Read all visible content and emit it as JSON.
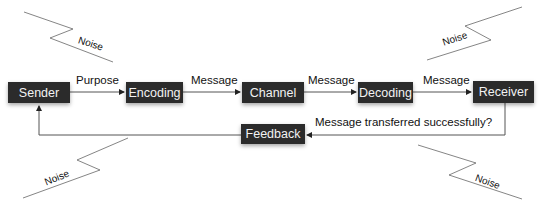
{
  "diagram": {
    "nodes": [
      {
        "id": "sender",
        "label": "Sender"
      },
      {
        "id": "encoding",
        "label": "Encoding"
      },
      {
        "id": "channel",
        "label": "Channel"
      },
      {
        "id": "decoding",
        "label": "Decoding"
      },
      {
        "id": "receiver",
        "label": "Receiver"
      },
      {
        "id": "feedback",
        "label": "Feedback"
      }
    ],
    "edges": [
      {
        "from": "sender",
        "to": "encoding",
        "label": "Purpose"
      },
      {
        "from": "encoding",
        "to": "channel",
        "label": "Message"
      },
      {
        "from": "channel",
        "to": "decoding",
        "label": "Message"
      },
      {
        "from": "decoding",
        "to": "receiver",
        "label": "Message"
      },
      {
        "from": "receiver",
        "to": "feedback",
        "label": "Message transferred successfully?"
      },
      {
        "from": "feedback",
        "to": "sender",
        "label": ""
      }
    ],
    "noise": [
      {
        "position": "top-left",
        "label": "Noise"
      },
      {
        "position": "top-right",
        "label": "Noise"
      },
      {
        "position": "bottom-left",
        "label": "Noise"
      },
      {
        "position": "bottom-right",
        "label": "Noise"
      }
    ],
    "colors": {
      "box": "#2b2b2b",
      "box_text": "#f2f2f2",
      "line": "#555555"
    }
  }
}
